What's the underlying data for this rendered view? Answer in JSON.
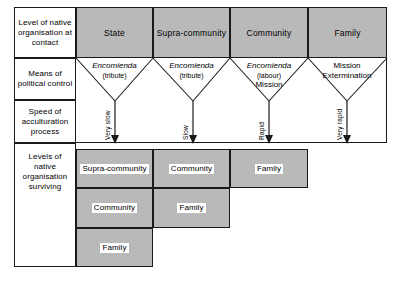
{
  "figure": {
    "type": "flow-matrix-diagram",
    "background_color": "#ffffff",
    "shade_color": "#b9b9b9",
    "line_color": "#1a1a1a"
  },
  "row_labels": [
    {
      "id": "row-label-contact",
      "text": "Level of native organisation at contact"
    },
    {
      "id": "row-label-control",
      "text": "Means of political control"
    },
    {
      "id": "row-label-speed",
      "text": "Speed of acculturation process"
    },
    {
      "id": "row-label-surviving",
      "text": "Levels of native organisation surviving"
    }
  ],
  "header_cells": [
    {
      "id": "header-state",
      "label": "State"
    },
    {
      "id": "header-supra-community",
      "label": "Supra-community"
    },
    {
      "id": "header-community",
      "label": "Community"
    },
    {
      "id": "header-family",
      "label": "Family"
    }
  ],
  "control_means": [
    {
      "id": "control-state",
      "line1": "Encomienda",
      "line2": "(tribute)",
      "line3": ""
    },
    {
      "id": "control-supra-community",
      "line1": "Encomienda",
      "line2": "(tribute)",
      "line3": ""
    },
    {
      "id": "control-community",
      "line1": "Encomienda",
      "line2": "(labour)",
      "line3": "Mission"
    },
    {
      "id": "control-family",
      "line1": "Mission",
      "line2": "Extermination",
      "line3": ""
    }
  ],
  "speeds": [
    {
      "id": "speed-state",
      "label": "Very slow"
    },
    {
      "id": "speed-supra-community",
      "label": "Slow"
    },
    {
      "id": "speed-community",
      "label": "Rapid"
    },
    {
      "id": "speed-family",
      "label": "Very rapid"
    }
  ],
  "surviving_columns": [
    {
      "id": "surviving-col-1",
      "boxes": [
        {
          "id": "surviving-1-supra-community",
          "label": "Supra-community"
        },
        {
          "id": "surviving-1-community",
          "label": "Community"
        },
        {
          "id": "surviving-1-family",
          "label": "Family"
        }
      ]
    },
    {
      "id": "surviving-col-2",
      "boxes": [
        {
          "id": "surviving-2-community",
          "label": "Community"
        },
        {
          "id": "surviving-2-family",
          "label": "Family"
        }
      ]
    },
    {
      "id": "surviving-col-3",
      "boxes": [
        {
          "id": "surviving-3-family",
          "label": "Family"
        }
      ]
    },
    {
      "id": "surviving-col-4",
      "boxes": []
    }
  ]
}
